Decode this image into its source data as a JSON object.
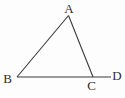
{
  "figure": {
    "kind": "geometry-diagram",
    "background_color": "#fdfdfd",
    "line_color": "#3a3a3a",
    "label_color": "#2e2e2e",
    "width": 125,
    "height": 98,
    "points": {
      "A": {
        "x": 68.5,
        "y": 15.5
      },
      "B": {
        "x": 17,
        "y": 77
      },
      "C": {
        "x": 93,
        "y": 77
      },
      "D_end": {
        "x": 111,
        "y": 77
      }
    },
    "segments": [
      {
        "name": "side-AB",
        "from": "A",
        "to": "B"
      },
      {
        "name": "side-AC",
        "from": "A",
        "to": "C"
      },
      {
        "name": "line-BCD",
        "from": "B",
        "to": "D_end"
      }
    ],
    "labels": [
      {
        "name": "vertex-label-A",
        "text": "A",
        "x": 69,
        "y": 13
      },
      {
        "name": "vertex-label-B",
        "text": "B",
        "x": 7.5,
        "y": 83
      },
      {
        "name": "vertex-label-C",
        "text": "C",
        "x": 91.5,
        "y": 90
      },
      {
        "name": "vertex-label-D",
        "text": "D",
        "x": 117,
        "y": 80
      }
    ]
  }
}
